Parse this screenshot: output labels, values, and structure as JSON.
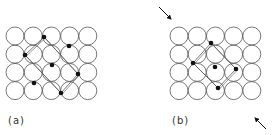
{
  "panels": [
    {
      "label": "(a)",
      "label_pos": [
        8,
        120
      ],
      "grid": {
        "origin": [
          6,
          27
        ],
        "cols": 5,
        "rows": 4,
        "spacing": 18.2,
        "radius": 9
      },
      "dots": [
        [
          44,
          37
        ],
        [
          25,
          55
        ],
        [
          69,
          46
        ],
        [
          52,
          65
        ],
        [
          78,
          74
        ],
        [
          34,
          83
        ],
        [
          61,
          93
        ]
      ],
      "lines": [
        [
          44,
          37,
          25,
          55
        ],
        [
          44,
          37,
          78,
          74
        ],
        [
          25,
          55,
          61,
          93
        ],
        [
          78,
          74,
          61,
          93
        ]
      ]
    },
    {
      "label": "(b)",
      "label_pos": [
        172,
        120
      ],
      "grid": {
        "origin": [
          170,
          27
        ],
        "cols": 5,
        "rows": 4,
        "spacing": 18.2,
        "radius": 9
      },
      "dots": [
        [
          211,
          43
        ],
        [
          193,
          63
        ],
        [
          215,
          67
        ],
        [
          236,
          69
        ],
        [
          218,
          88
        ]
      ],
      "lines": [
        [
          211,
          43,
          193,
          63
        ],
        [
          211,
          43,
          236,
          69
        ],
        [
          193,
          63,
          218,
          88
        ],
        [
          236,
          69,
          218,
          88
        ]
      ],
      "arrows": [
        {
          "from": [
            159,
            7
          ],
          "to": [
            171,
            19
          ]
        },
        {
          "from": [
            266,
            129
          ],
          "to": [
            255,
            118
          ]
        }
      ]
    }
  ],
  "colors": {
    "stroke": "#555555",
    "dot": "#111111",
    "background": "#ffffff"
  }
}
